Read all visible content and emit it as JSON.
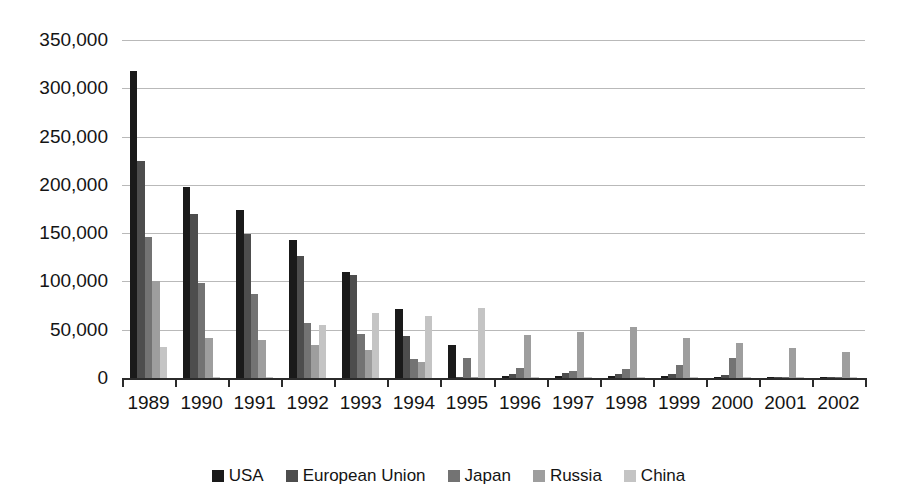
{
  "chart_data": {
    "type": "bar",
    "title": "",
    "subtitle": "",
    "xlabel": "",
    "ylabel": "",
    "grid": true,
    "legend_position": "bottom",
    "ylim": [
      0,
      350000
    ],
    "y_ticks": [
      0,
      50000,
      100000,
      150000,
      200000,
      250000,
      300000,
      350000
    ],
    "y_tick_labels": [
      "0",
      "50,000",
      "100,000",
      "150,000",
      "200,000",
      "250,000",
      "300,000",
      "350,000"
    ],
    "categories": [
      "1989",
      "1990",
      "1991",
      "1992",
      "1993",
      "1994",
      "1995",
      "1996",
      "1997",
      "1998",
      "1999",
      "2000",
      "2001",
      "2002"
    ],
    "series": [
      {
        "name": "USA",
        "color": "#1a1a1a",
        "values": [
          318000,
          198000,
          174000,
          143000,
          110000,
          71000,
          34000,
          2000,
          2500,
          2000,
          2500,
          1500,
          1000,
          500
        ]
      },
      {
        "name": "European Union",
        "color": "#4d4d4d",
        "values": [
          225000,
          170000,
          149000,
          126000,
          107000,
          44000,
          1500,
          4000,
          5000,
          4000,
          4500,
          3500,
          1500,
          1000
        ]
      },
      {
        "name": "Japan",
        "color": "#737373",
        "values": [
          146000,
          98000,
          87000,
          57000,
          46000,
          20000,
          21000,
          10000,
          7500,
          9000,
          13000,
          21000,
          1500,
          1500
        ]
      },
      {
        "name": "Russia",
        "color": "#9e9e9e",
        "values": [
          100000,
          41000,
          39000,
          34000,
          29000,
          17000,
          1000,
          45000,
          48000,
          53000,
          41000,
          36000,
          31000,
          27000
        ]
      },
      {
        "name": "China",
        "color": "#c4c4c4",
        "values": [
          32000,
          1000,
          1500,
          55000,
          67000,
          64000,
          73000,
          1500,
          1500,
          1500,
          1500,
          1500,
          1000,
          1000
        ]
      }
    ]
  }
}
